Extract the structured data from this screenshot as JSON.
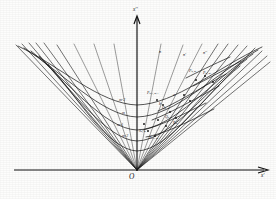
{
  "figure": {
    "kind": "mathematical-diagram",
    "background_color": "#fdfdfc",
    "ink_color": "#151515"
  },
  "axes": {
    "vertical": {
      "name": "vertical-axis",
      "label": "x''",
      "label_x": 133,
      "label_y": 9,
      "x": 137,
      "y_top": 16,
      "y_bottom": 170,
      "arrow": "up"
    },
    "horizontal": {
      "name": "horizontal-axis",
      "label": "x'",
      "label_x": 262,
      "label_y": 174,
      "y": 170,
      "x_left": 14,
      "x_right": 268,
      "arrow": "right"
    },
    "origin": {
      "label": "O",
      "x": 130,
      "y": 176,
      "vertex_x": 137,
      "vertex_y": 170
    }
  },
  "curve_labels": [
    {
      "text": "m-2",
      "x": 120,
      "y": 101
    },
    {
      "text": "m",
      "x": 122,
      "y": 114
    },
    {
      "text": "m-1",
      "x": 118,
      "y": 126
    },
    {
      "text": "m-2",
      "x": 123,
      "y": 137
    }
  ],
  "ray_labels": [
    {
      "text": "n",
      "x": 159,
      "y": 52
    },
    {
      "text": "n'",
      "x": 183,
      "y": 55
    },
    {
      "text": "n''",
      "x": 203,
      "y": 53
    },
    {
      "text": "a",
      "x": 173,
      "y": 95
    },
    {
      "text": "b",
      "x": 160,
      "y": 104
    }
  ],
  "point_labels": [
    {
      "text": "P",
      "sub": "n-1, m-1",
      "x": 148,
      "y": 94
    },
    {
      "text": "P",
      "sub": "n, m",
      "x": 190,
      "y": 72
    },
    {
      "text": "P",
      "sub": "n', m'",
      "x": 203,
      "y": 74
    },
    {
      "text": "Q",
      "sub": "n, m",
      "x": 163,
      "y": 109
    },
    {
      "text": "Q",
      "sub": "n-1",
      "x": 166,
      "y": 118
    },
    {
      "text": "R",
      "sub": "m",
      "x": 174,
      "y": 124
    },
    {
      "text": "S",
      "sub": "n, m",
      "x": 140,
      "y": 132
    },
    {
      "text": "T",
      "sub": "n-1, m",
      "x": 150,
      "y": 139
    }
  ],
  "geometry": {
    "rays_left_count": 9,
    "rays_right_count": 11,
    "level_curves_count": 5,
    "marked_points_count": 14
  }
}
